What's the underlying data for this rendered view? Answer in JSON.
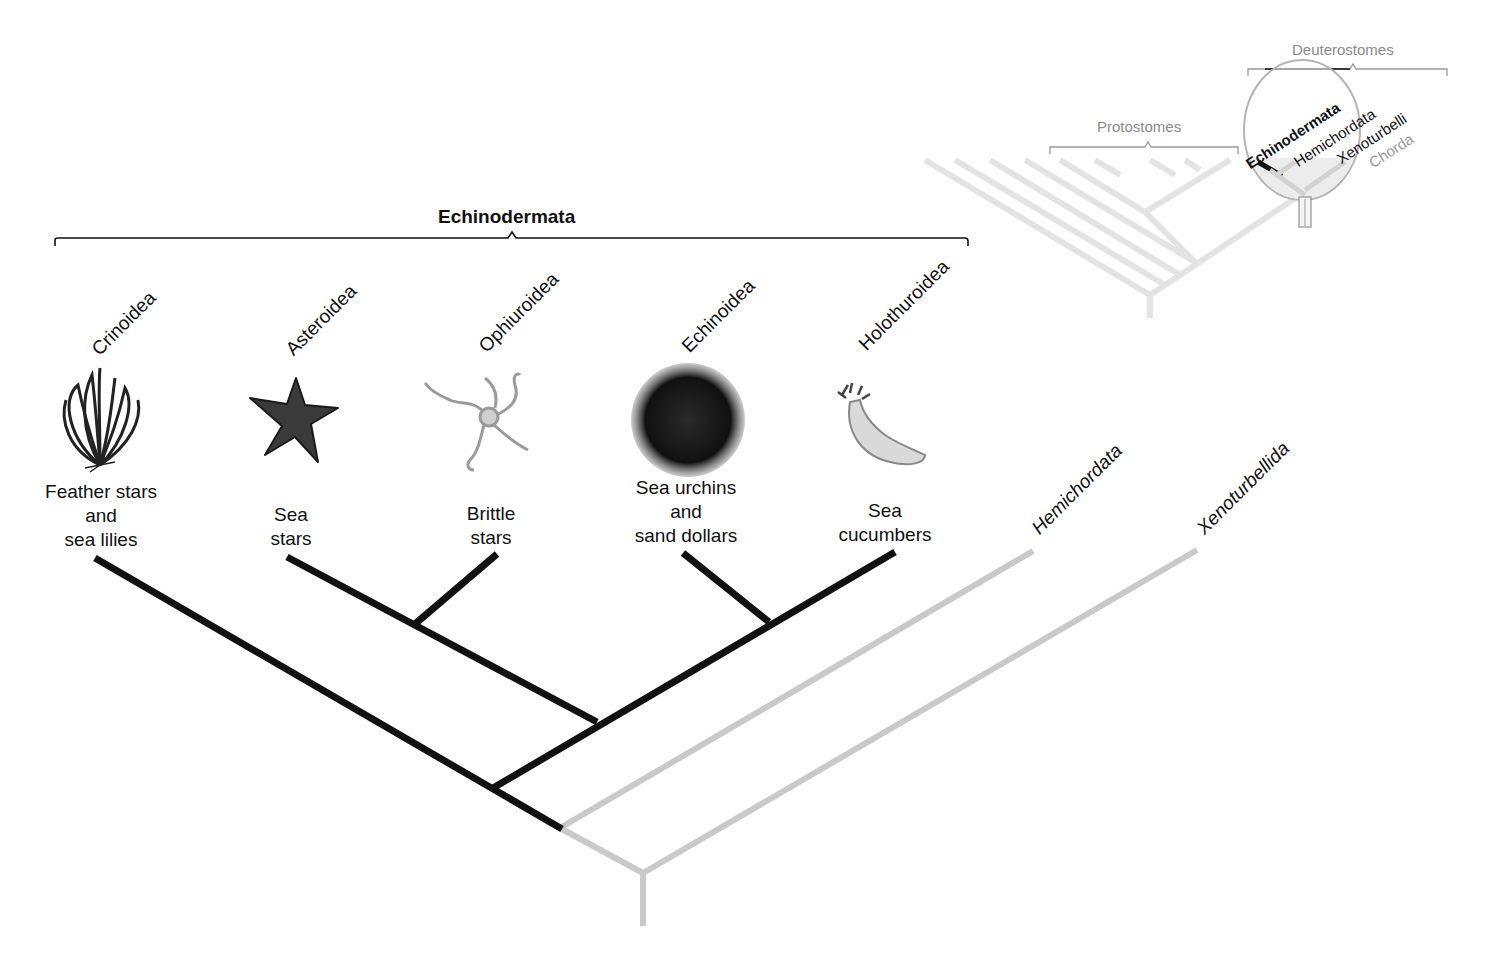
{
  "title": "Echinodermata",
  "taxa": [
    {
      "name": "Crinoidea",
      "common": [
        "Feather stars",
        "and",
        "sea lilies"
      ]
    },
    {
      "name": "Asteroidea",
      "common": [
        "Sea",
        "stars"
      ]
    },
    {
      "name": "Ophiuroidea",
      "common": [
        "Brittle",
        "stars"
      ]
    },
    {
      "name": "Echinoidea",
      "common": [
        "Sea urchins",
        "and",
        "sand dollars"
      ]
    },
    {
      "name": "Holothuroidea",
      "common": [
        "Sea",
        "cucumbers"
      ]
    }
  ],
  "outgroups": [
    {
      "name": "Hemichordata"
    },
    {
      "name": "Xenoturbellida"
    }
  ],
  "inset": {
    "protostomes": "Protostomes",
    "deuterostomes": "Deuterostomes",
    "magnified": [
      "Echinodermata",
      "Hemichordata",
      "Xenoturbelli",
      "Chorda"
    ],
    "magnified_full": [
      "Echinodermata",
      "Hemichordata",
      "Xenoturbellida",
      "Chordata"
    ]
  },
  "colors": {
    "echinoderm_branch": "#111111",
    "other_branch": "#c8c8c8",
    "inset_branch": "#e2e2e2",
    "inset_text": "#8a8a8a"
  }
}
